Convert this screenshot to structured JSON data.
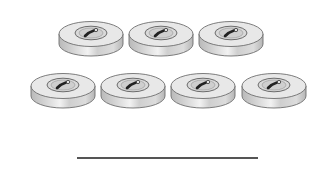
{
  "scene": {
    "description": "Counting worksheet: buttons arranged in two rows with an answer line below",
    "object": "button-icon",
    "count": 7,
    "rows": [
      {
        "count": 3,
        "y": 19,
        "x": [
          58,
          128,
          198
        ]
      },
      {
        "count": 4,
        "y": 71,
        "x": [
          30,
          100,
          170,
          241
        ]
      }
    ],
    "answer_line": {
      "x": 77,
      "y": 157,
      "width": 181
    },
    "colors": {
      "button_face": "#e6e6e6",
      "button_side": "#c8c8c8",
      "button_outline": "#6e6e6e",
      "button_inner_ring": "#d4d4d4",
      "thread": "#2a2a2a",
      "line": "#555555"
    }
  }
}
